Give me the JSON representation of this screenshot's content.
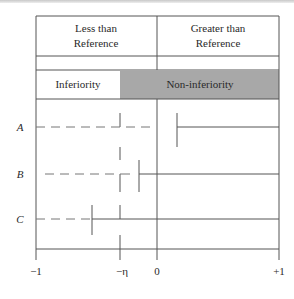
{
  "diagram": {
    "header": {
      "left": "Less than Reference",
      "left_line1": "Less than",
      "left_line2": "Reference",
      "right_line1": "Greater than",
      "right_line2": "Reference"
    },
    "regions": {
      "inferiority": "Inferiority",
      "non_inferiority": "Non-inferiority",
      "shade_color": "#a8a8a8"
    },
    "rows": [
      {
        "label": "A",
        "lower_bound_x": 0.12,
        "note": "CI lower limit above 0"
      },
      {
        "label": "B",
        "lower_bound_x": -0.12,
        "note": "CI lower limit between -eta and 0"
      },
      {
        "label": "C",
        "lower_bound_x": -0.42,
        "note": "CI lower limit below -eta"
      }
    ],
    "axis": {
      "ticks": [
        {
          "value": -1,
          "label": "−1"
        },
        {
          "value": "-eta",
          "label": "−η"
        },
        {
          "value": 0,
          "label": "0"
        },
        {
          "value": 1,
          "label": "+1"
        }
      ]
    },
    "colors": {
      "line": "#555555",
      "dash": "#777777",
      "shade": "#a8a8a8"
    }
  }
}
